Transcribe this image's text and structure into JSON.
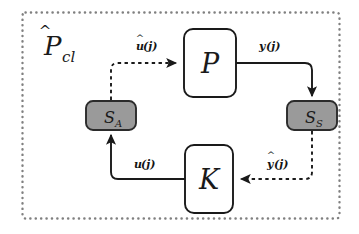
{
  "diagram": {
    "outer_container": {
      "label_script": "P",
      "label_subscript": "cl",
      "label_hat": "^",
      "label_full": "P̂cl",
      "border_style": "dotted",
      "border_color": "#808080"
    },
    "blocks": [
      {
        "id": "plant",
        "label": "P",
        "subscript": "",
        "shape": "rounded-rect",
        "fill": "#ffffff",
        "stroke": "#1a1a1a"
      },
      {
        "id": "controller",
        "label": "K",
        "subscript": "",
        "shape": "rounded-rect",
        "fill": "#ffffff",
        "stroke": "#1a1a1a"
      },
      {
        "id": "actuator",
        "label": "S",
        "subscript": "A",
        "shape": "rounded-rect",
        "fill": "#9a9a9a",
        "stroke": "#2b2b2b"
      },
      {
        "id": "sensor",
        "label": "S",
        "subscript": "S",
        "shape": "rounded-rect",
        "fill": "#9a9a9a",
        "stroke": "#2b2b2b"
      }
    ],
    "edges": [
      {
        "id": "uhat",
        "base": "u",
        "hat": true,
        "arg": "(j)",
        "label": "û(j)",
        "style": "dashed",
        "from": "actuator",
        "to": "plant"
      },
      {
        "id": "y",
        "base": "y",
        "hat": false,
        "arg": "(j)",
        "label": "y(j)",
        "style": "solid",
        "from": "plant",
        "to": "sensor"
      },
      {
        "id": "yhat",
        "base": "y",
        "hat": true,
        "arg": "(j)",
        "label": "ŷ(j)",
        "style": "dashed",
        "from": "sensor",
        "to": "controller"
      },
      {
        "id": "u",
        "base": "u",
        "hat": false,
        "arg": "(j)",
        "label": "u(j)",
        "style": "solid",
        "from": "controller",
        "to": "actuator"
      }
    ],
    "colors": {
      "line": "#1a1a1a",
      "gray_fill": "#9a9a9a",
      "dotted_border": "#808080",
      "background": "#ffffff"
    }
  }
}
